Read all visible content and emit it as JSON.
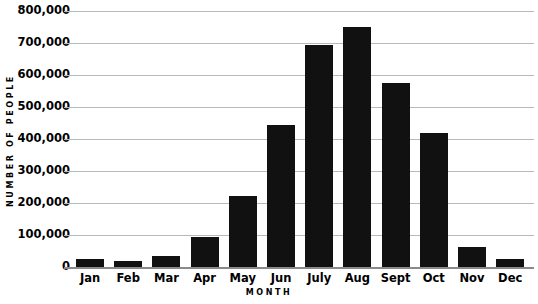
{
  "chart_data": {
    "type": "bar",
    "title": "",
    "xlabel": "MONTH",
    "ylabel": "NUMBER OF PEOPLE",
    "categories": [
      "Jan",
      "Feb",
      "Mar",
      "Apr",
      "May",
      "Jun",
      "July",
      "Aug",
      "Sept",
      "Oct",
      "Nov",
      "Dec"
    ],
    "values": [
      25000,
      20000,
      35000,
      95000,
      222000,
      445000,
      695000,
      750000,
      575000,
      420000,
      62000,
      25000
    ],
    "ylim": [
      0,
      800000
    ],
    "ytick_values": [
      0,
      100000,
      200000,
      300000,
      400000,
      500000,
      600000,
      700000,
      800000
    ],
    "ytick_labels": [
      "0",
      "100,000",
      "200,000",
      "300,000",
      "400,000",
      "500,000",
      "600,000",
      "700,000",
      "800,000"
    ],
    "grid": true,
    "legend": false,
    "bar_color": "#111111",
    "gridline_color": "#b9b9b9",
    "axis_color": "#8a8a8a",
    "background_color": "#ffffff"
  }
}
